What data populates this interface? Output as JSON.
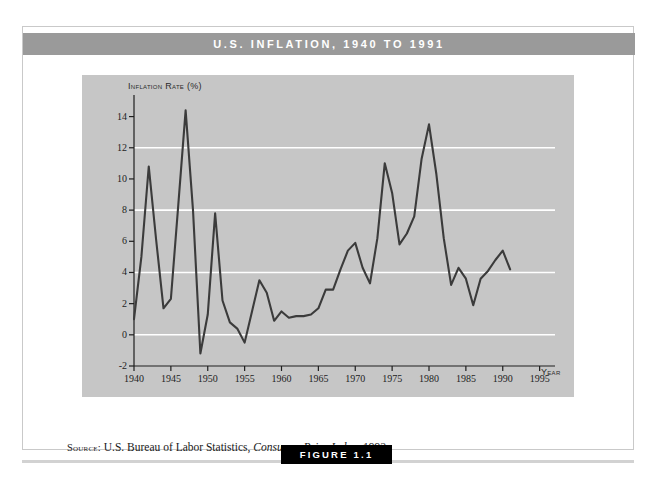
{
  "figure": {
    "title": "U.S. Inflation, 1940 to 1991",
    "badge_label": "FIGURE 1.1",
    "source_prefix": "Source:",
    "source_body": "U.S. Bureau of Labor Statistics,",
    "source_italic": "Consumer Price Index, 1992."
  },
  "colors": {
    "title_bar": "#9a9a9a",
    "plot_background": "#c6c6c6",
    "gridline": "#ffffff",
    "data_line": "#3b3b3b",
    "axis": "#1e1e1e",
    "badge": "#000000",
    "card_border": "#c9c9c9"
  },
  "chart_data": {
    "type": "line",
    "title": "U.S. Inflation, 1940 to 1991",
    "xlabel": "Year",
    "ylabel": "Inflation Rate (%)",
    "xlim": [
      1940,
      1996
    ],
    "ylim": [
      -2,
      15
    ],
    "grid": true,
    "grid_axis": "y",
    "gridlines": [
      0,
      4,
      8,
      12
    ],
    "legend": false,
    "xticks": [
      1940,
      1945,
      1950,
      1955,
      1960,
      1965,
      1970,
      1975,
      1980,
      1985,
      1990,
      1995
    ],
    "xtick_labels": [
      "1940",
      "1945",
      "1950",
      "1955",
      "1960",
      "1965",
      "1970",
      "1975",
      "1980",
      "1985",
      "1990",
      "1995"
    ],
    "yticks": [
      -2,
      0,
      2,
      4,
      6,
      8,
      10,
      12,
      14
    ],
    "ytick_labels": [
      "-2",
      "0",
      "2",
      "4",
      "6",
      "8",
      "10",
      "12",
      "14"
    ],
    "series": [
      {
        "name": "U.S. Inflation Rate",
        "x": [
          1940,
          1941,
          1942,
          1943,
          1944,
          1945,
          1946,
          1947,
          1948,
          1949,
          1950,
          1951,
          1952,
          1953,
          1954,
          1955,
          1956,
          1957,
          1958,
          1959,
          1960,
          1961,
          1962,
          1963,
          1964,
          1965,
          1966,
          1967,
          1968,
          1969,
          1970,
          1971,
          1972,
          1973,
          1974,
          1975,
          1976,
          1977,
          1978,
          1979,
          1980,
          1981,
          1982,
          1983,
          1984,
          1985,
          1986,
          1987,
          1988,
          1989,
          1990,
          1991
        ],
        "values": [
          1.0,
          5.0,
          10.8,
          6.1,
          1.7,
          2.3,
          8.3,
          14.4,
          8.0,
          -1.2,
          1.3,
          7.8,
          2.2,
          0.8,
          0.4,
          -0.5,
          1.5,
          3.5,
          2.7,
          0.9,
          1.5,
          1.1,
          1.2,
          1.2,
          1.3,
          1.7,
          2.9,
          2.9,
          4.2,
          5.4,
          5.9,
          4.3,
          3.3,
          6.2,
          11.0,
          9.1,
          5.8,
          6.5,
          7.6,
          11.3,
          13.5,
          10.3,
          6.2,
          3.2,
          4.3,
          3.6,
          1.9,
          3.6,
          4.1,
          4.8,
          5.4,
          4.2
        ]
      }
    ]
  }
}
